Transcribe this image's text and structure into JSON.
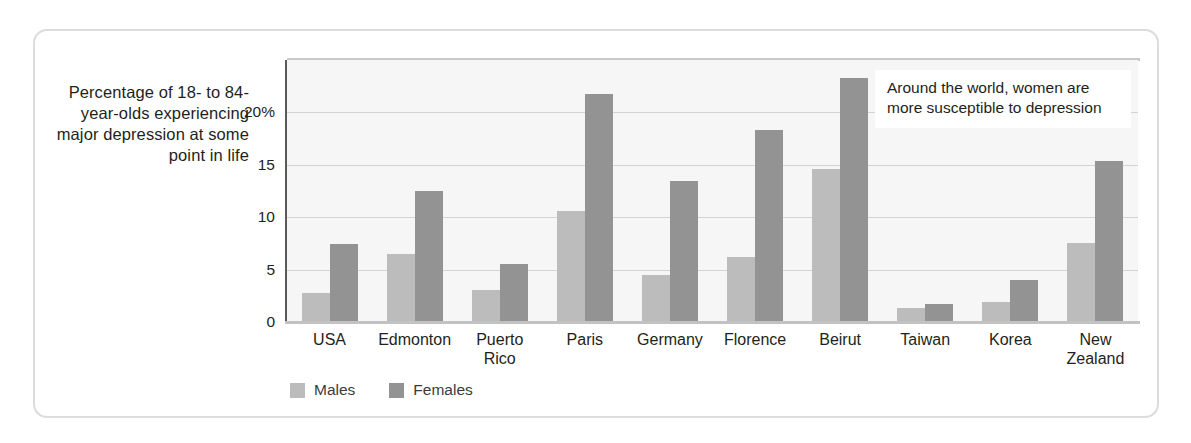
{
  "axis_title": "Percentage of 18-\nto 84-year-olds\nexperiencing\nmajor\ndepression\nat some\npoint in life",
  "annotation": "Around the world, women are more susceptible to depression",
  "legend": {
    "males_label": "Males",
    "females_label": "Females",
    "males_color": "#bcbcbc",
    "females_color": "#939393"
  },
  "chart_data": {
    "type": "bar",
    "title": "",
    "xlabel": "",
    "ylabel": "Percentage of 18- to 84-year-olds experiencing major depression at some point in life",
    "ylim": [
      0,
      25
    ],
    "yticks": [
      0,
      5,
      10,
      15,
      20
    ],
    "ytick_labels": [
      "0",
      "5",
      "10",
      "15",
      "20%"
    ],
    "grid": true,
    "legend_position": "bottom-left",
    "categories": [
      "USA",
      "Edmonton",
      "Puerto\nRico",
      "Paris",
      "Germany",
      "Florence",
      "Beirut",
      "Taiwan",
      "Korea",
      "New\nZealand"
    ],
    "series": [
      {
        "name": "Males",
        "color": "#bcbcbc",
        "values": [
          2.8,
          6.5,
          3.1,
          10.6,
          4.5,
          6.2,
          14.6,
          1.3,
          1.9,
          7.5
        ]
      },
      {
        "name": "Females",
        "color": "#939393",
        "values": [
          7.4,
          12.5,
          5.5,
          21.8,
          13.5,
          18.3,
          23.3,
          1.7,
          4.0,
          15.4
        ]
      }
    ]
  }
}
